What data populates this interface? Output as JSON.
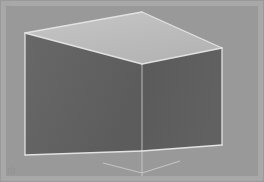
{
  "scene": {
    "title": "3D open box render",
    "description": "Grayscale 3D perspective render of an open rectangular box with a light top panel and two dark interior side panels, drawn over a light wireframe ground plane.",
    "canvas": {
      "width": 264,
      "height": 182
    },
    "colors": {
      "background": "#999999",
      "border_frame": "#a8a8a8",
      "top_face": "#bdbdbd",
      "left_face": "#606060",
      "right_face": "#5a5a5a",
      "wireframe": "#e2e2e2",
      "wireframe_soft": "#c9c9c9"
    },
    "faces": [
      {
        "name": "top-face",
        "shade": "light",
        "fill": "#bdbdbd",
        "points": "25,33 142,12 222,48 142,64"
      },
      {
        "name": "left-face",
        "shade": "dark",
        "fill": "#606060",
        "points": "25,33 142,64 142,151 25,155"
      },
      {
        "name": "right-face",
        "shade": "dark",
        "fill": "#5a5a5a",
        "points": "142,64 222,48 222,145 142,151"
      }
    ],
    "edges": [
      {
        "name": "top-back-left-edge",
        "x1": 25,
        "y1": 33,
        "x2": 142,
        "y2": 12
      },
      {
        "name": "top-back-right-edge",
        "x1": 142,
        "y1": 12,
        "x2": 222,
        "y2": 48
      },
      {
        "name": "top-front-left-edge",
        "x1": 25,
        "y1": 33,
        "x2": 142,
        "y2": 64
      },
      {
        "name": "top-front-right-edge",
        "x1": 142,
        "y1": 64,
        "x2": 222,
        "y2": 48
      },
      {
        "name": "vertical-center-edge",
        "x1": 142,
        "y1": 64,
        "x2": 142,
        "y2": 151
      },
      {
        "name": "vertical-left-edge",
        "x1": 25,
        "y1": 33,
        "x2": 25,
        "y2": 155
      },
      {
        "name": "vertical-right-edge",
        "x1": 222,
        "y1": 48,
        "x2": 222,
        "y2": 145
      },
      {
        "name": "bottom-left-edge",
        "x1": 25,
        "y1": 155,
        "x2": 142,
        "y2": 151
      },
      {
        "name": "bottom-right-edge",
        "x1": 142,
        "y1": 151,
        "x2": 222,
        "y2": 145
      }
    ],
    "ground_wireframe": [
      {
        "name": "ground-vertical-axis",
        "x1": 142,
        "y1": 151,
        "x2": 142,
        "y2": 176
      },
      {
        "name": "ground-left-spoke",
        "x1": 142,
        "y1": 173,
        "x2": 103,
        "y2": 163
      },
      {
        "name": "ground-right-spoke",
        "x1": 142,
        "y1": 173,
        "x2": 180,
        "y2": 161
      },
      {
        "name": "apex-vertical-axis",
        "x1": 142,
        "y1": 12,
        "x2": 142,
        "y2": 64
      }
    ],
    "watermarks": {
      "top_left": "▪▪▪",
      "bottom_left": "ılı"
    }
  }
}
